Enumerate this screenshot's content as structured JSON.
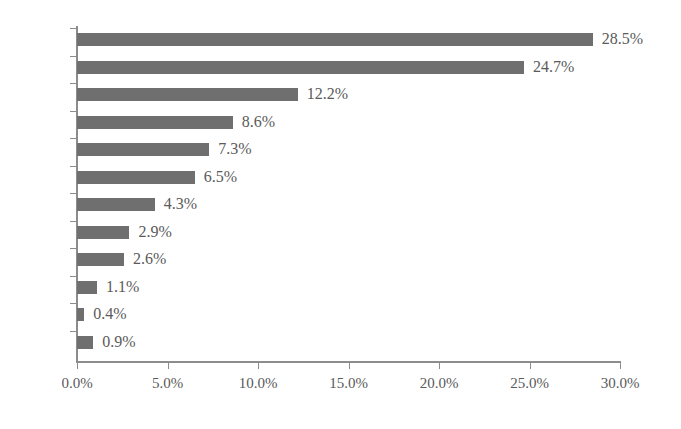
{
  "chart_data": {
    "type": "bar",
    "orientation": "horizontal",
    "title": "",
    "subtitle": "",
    "xlabel": "",
    "ylabel": "",
    "grid": false,
    "legend": false,
    "xlim": [
      0,
      30
    ],
    "xticks": [
      0,
      5,
      10,
      15,
      20,
      25,
      30
    ],
    "xtick_labels": [
      "0.0%",
      "5.0%",
      "10.0%",
      "15.0%",
      "20.0%",
      "25.0%",
      "30.0%"
    ],
    "categories": [
      "快消",
      "汽車",
      "日化",
      "娛樂",
      "電商",
      "IT",
      "應用",
      "地產",
      "金融",
      "教育",
      "服飾",
      "其他"
    ],
    "values": [
      28.5,
      24.7,
      12.2,
      8.6,
      7.3,
      6.5,
      4.3,
      2.9,
      2.6,
      1.1,
      0.4,
      0.9
    ],
    "data_labels": [
      "28.5%",
      "24.7%",
      "12.2%",
      "8.6%",
      "7.3%",
      "6.5%",
      "4.3%",
      "2.9%",
      "2.6%",
      "1.1%",
      "0.4%",
      "0.9%"
    ],
    "colors": {
      "bar": "#6f6f6f",
      "axis": "#8c8c8c",
      "background": "#ffffff",
      "category_text": "#15120f",
      "value_text": "#5a5a5a",
      "tick_text": "#5a5a5a"
    }
  }
}
